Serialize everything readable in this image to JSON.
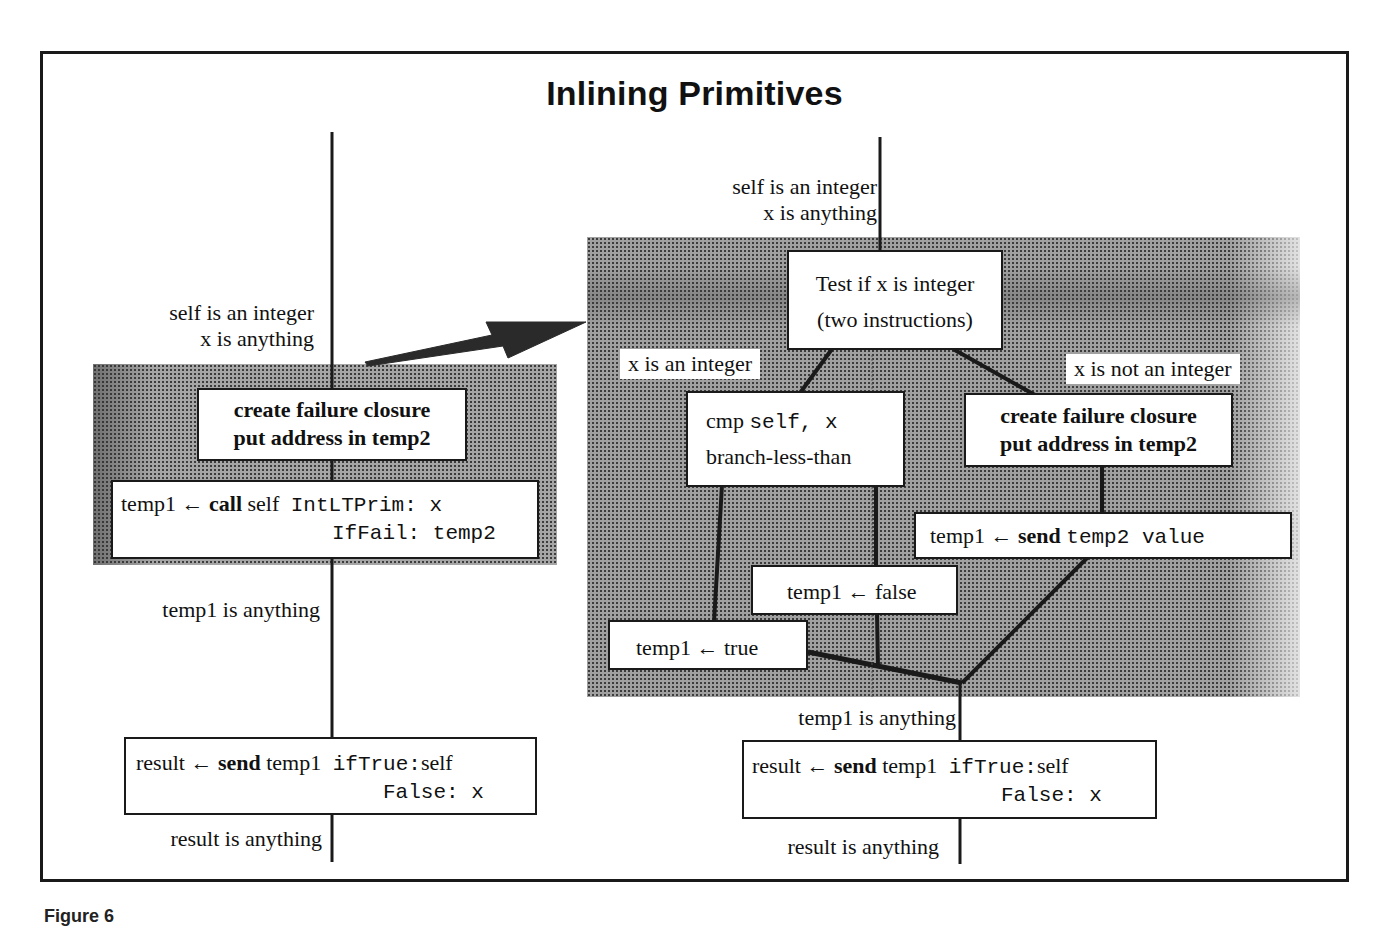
{
  "title": "Inlining Primitives",
  "caption": "Figure 6",
  "left": {
    "precondition": [
      "self is an integer",
      "x is anything"
    ],
    "closure_box": [
      "create failure closure",
      "put address in temp2"
    ],
    "call_box": {
      "lhs": "temp1",
      "arrow": "←",
      "keyword": "call",
      "receiver": "self",
      "selector_1": "IntLTPrim: x",
      "selector_2": "IfFail: temp2"
    },
    "after_call": "temp1 is anything",
    "result_box": {
      "lhs": "result",
      "arrow": "←",
      "keyword": "send",
      "receiver": "temp1",
      "selector_1": "ifTrue:",
      "arg_1": "self",
      "selector_2": "False: x"
    },
    "postcondition": "result is anything"
  },
  "right": {
    "precondition": [
      "self is an integer",
      "x is anything"
    ],
    "test_box": [
      "Test if x is integer",
      "(two instructions)"
    ],
    "branch_int_label": "x is an integer",
    "branch_not_int_label": "x is not an integer",
    "cmp_box": {
      "op": "cmp",
      "args": "self, x",
      "line2": "branch-less-than"
    },
    "closure_box": [
      "create failure closure",
      "put address in temp2"
    ],
    "send_box": {
      "lhs": "temp1",
      "arrow": "←",
      "keyword": "send",
      "code": "temp2 value"
    },
    "false_box": "temp1 ← false",
    "true_box": "temp1 ← true",
    "after_merge": "temp1 is anything",
    "result_box": {
      "lhs": "result",
      "arrow": "←",
      "keyword": "send",
      "receiver": "temp1",
      "selector_1": "ifTrue:",
      "arg_1": "self",
      "selector_2": "False: x"
    },
    "postcondition": "result is anything"
  },
  "colors": {
    "line": "#1a1a1a",
    "shading": "#9a9a9a",
    "box_fill": "#ffffff"
  }
}
